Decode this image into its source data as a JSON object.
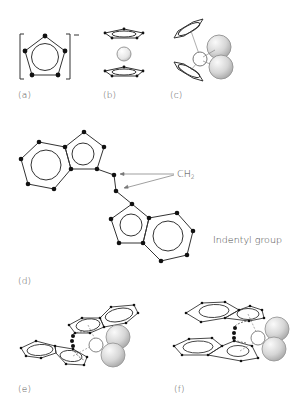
{
  "figure": {
    "panels": [
      {
        "id": "a",
        "label": "(a)",
        "description": "cyclopentadienyl anion in brackets",
        "charge": "−"
      },
      {
        "id": "b",
        "label": "(b)",
        "description": "sandwich metallocene: metal sphere between two parallel rings"
      },
      {
        "id": "c",
        "label": "(c)",
        "description": "bent metallocene with two large ligand spheres"
      },
      {
        "id": "d",
        "label": "(d)",
        "description": "bridged bis-indenyl ligand"
      },
      {
        "id": "e",
        "label": "(e)",
        "description": "ansa-metallocene with indenyl rings, rac-like"
      },
      {
        "id": "f",
        "label": "(f)",
        "description": "ansa-metallocene with indenyl rings, meso-like"
      }
    ],
    "annotations": {
      "ch2_label": "CH",
      "ch2_subscript": "2",
      "indenyl_label": "Indentyl group"
    },
    "colors": {
      "line": "#333333",
      "atom": "#111111",
      "sphere_light": "#f2f2f2",
      "sphere_dark": "#bdbdbd",
      "label_text": "#555555"
    }
  }
}
